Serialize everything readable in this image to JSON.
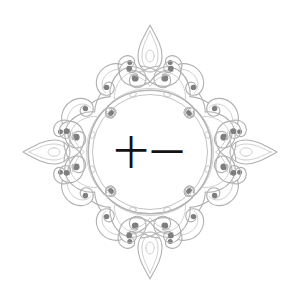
{
  "canvas": {
    "width": 300,
    "height": 307,
    "background_color": "#ffffff"
  },
  "artwork": {
    "title": "ornamental-medallion",
    "style": "four-fold-symmetric-filigree",
    "stroke_color": "#b0b0b0",
    "stroke_color_light": "#c9c9c9",
    "stroke_color_dark": "#8d8d8d",
    "dot_color": "#7e7e7e",
    "stroke_width": 1.1
  },
  "medallion": {
    "center_x": 150,
    "center_y": 152,
    "outer_ring_radius": 62,
    "inner_ring_radius": 57.5,
    "ring_color": "#b4b4b4",
    "ring_color_inner": "#c2c2c2"
  },
  "center_label": {
    "text": "十一",
    "color": "#131313",
    "font_size_px": 34
  },
  "finials": {
    "top": {
      "tip_x": 150,
      "tip_y": 25
    },
    "bottom": {
      "tip_x": 150,
      "tip_y": 282
    },
    "left": {
      "tip_x": 27,
      "tip_y": 152
    },
    "right": {
      "tip_x": 273,
      "tip_y": 152
    }
  }
}
